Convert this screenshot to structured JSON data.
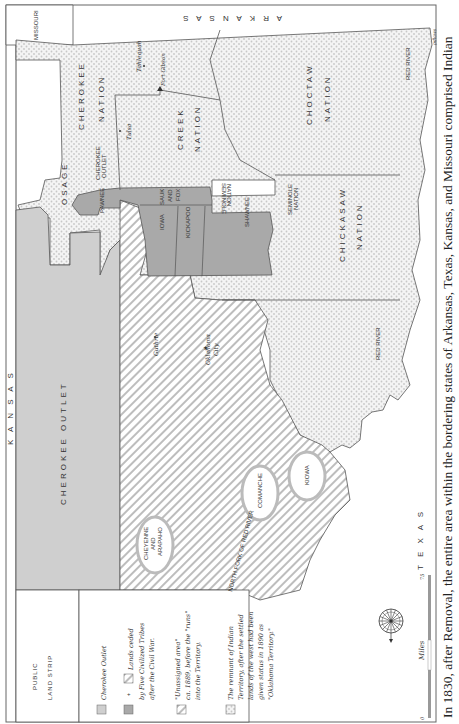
{
  "map": {
    "orientation": "rotated 90° clockwise",
    "states": {
      "kansas": "K A N S A S",
      "missouri": "MISSOURI",
      "arkansas": "A R K A N S A S",
      "texas": "T E X A S"
    },
    "regions": {
      "public_land_strip_line1": "PUBLIC",
      "public_land_strip_line2": "LAND STRIP",
      "cherokee_outlet": "CHEROKEE OUTLET",
      "cherokee_outlet_small_line1": "CHEROKEE",
      "cherokee_outlet_small_line2": "OUTLET",
      "osage": "OSAGE",
      "cherokee_nation_line1": "CHEROKEE",
      "cherokee_nation_line2": "NATION",
      "creek_nation_line1": "CREEK",
      "creek_nation_line2": "NATION",
      "choctaw_nation_line1": "CHOCTAW",
      "choctaw_nation_line2": "NATION",
      "chickasaw_nation_line1": "CHICKASAW",
      "chickasaw_nation_line2": "NATION",
      "seminole_nation_line1": "SEMINOLE",
      "seminole_nation_line2": "NATION",
      "seminole_nation_inverted_line1": "SEMINOLE",
      "seminole_nation_inverted_line2": "NATION",
      "pawnee": "PAWNEE",
      "sauk_and_fox_line1": "SAUK",
      "sauk_and_fox_line2": "AND",
      "sauk_and_fox_line3": "FOX",
      "iowa": "IOWA",
      "kickapoo": "KICKAPOO",
      "shawnee": "SHAWNEE",
      "cheyenne_arapaho_line1": "CHEYENNE",
      "cheyenne_arapaho_line2": "AND",
      "cheyenne_arapaho_line3": "ARAPAHO",
      "comanche": "COMANCHE",
      "kiowa": "KIOWA"
    },
    "cities": {
      "tahlequah": "Tahlequah",
      "fort_gibson": "Fort Gibson",
      "tulsa": "Tulsa",
      "guthrie": "Guthrie",
      "oklahoma_city_line1": "Oklahoma",
      "oklahoma_city_line2": "City"
    },
    "rivers": {
      "red_river_1": "RED RIVER",
      "red_river_2": "RED RIVER",
      "north_fork": "NORTH FORK OF RED RIVER",
      "pdlaws": "pdlaws"
    },
    "scale": {
      "start": "0",
      "end": "75",
      "unit": "Miles"
    },
    "compass": "compass-rose"
  },
  "legend": {
    "items": [
      {
        "swatch": "light-gray",
        "text_lines": [
          "Cherokee Outlet"
        ]
      },
      {
        "swatch": "dark-gray + hatched",
        "plus": "+",
        "text_lines": [
          "Lands ceded",
          "by Five Civilized Tribes",
          "after the Civil War."
        ]
      },
      {
        "swatch": "hatched",
        "text_lines": [
          "\"Unassigned area\"",
          "ca. 1889, before the \"runs\"",
          "into the Territory."
        ]
      },
      {
        "swatch": "dotted",
        "text_lines": [
          "The remnant of Indian",
          "Territory, after the settled",
          "lands of the west had been",
          "given status in 1890 as",
          "\"Oklahoma Territory.\""
        ]
      }
    ]
  },
  "caption": "In 1830, after Removal, the entire area within the bordering states of Arkansas, Texas, Kansas, and Missouri comprised Indian",
  "colors": {
    "light_gray": "#cfcfcf",
    "dark_gray": "#a9a9a9",
    "dots": "#c8c8c8",
    "hatch": "#b8b8b8",
    "lines": "#555555",
    "background": "#ffffff"
  }
}
